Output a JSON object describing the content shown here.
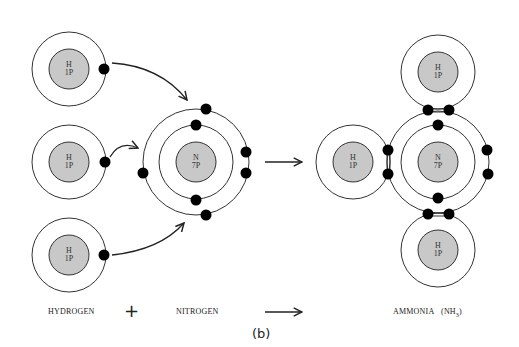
{
  "caption": "(b)",
  "colors": {
    "nucleus_fill": "#c8c8c8",
    "line": "#333333",
    "electron": "#000000",
    "background": "#ffffff"
  },
  "atoms": {
    "hydrogen": {
      "symbol": "H",
      "protons": "1P"
    },
    "nitrogen": {
      "symbol": "N",
      "protons": "7P"
    }
  },
  "labels": {
    "hydrogen": "HYDROGEN",
    "plus": "+",
    "nitrogen": "NITROGEN",
    "ammonia": "AMMONIA",
    "ammonia_formula": "(NH",
    "ammonia_subscript": "3",
    "ammonia_close": ")"
  },
  "reactants": {
    "hydrogen_atoms": 3,
    "nitrogen_inner_electrons": 2,
    "nitrogen_outer_electrons": 5
  },
  "product": {
    "name": "AMMONIA",
    "shared_pairs": 3,
    "lone_pair": 1
  }
}
